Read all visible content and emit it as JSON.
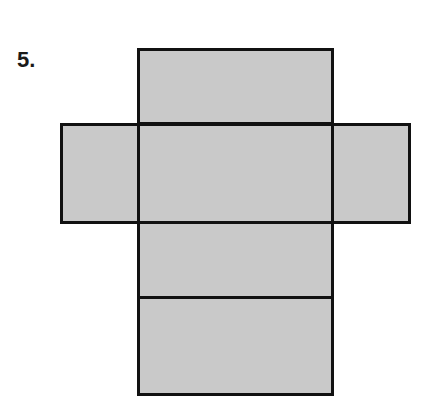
{
  "problem": {
    "number_label": "5."
  },
  "figure": {
    "type": "net-of-rectangular-prism",
    "fill_color": "#c9c9c9",
    "stroke_color": "#111111",
    "faces": [
      {
        "name": "top-face",
        "x": 137,
        "y": 48,
        "w": 197,
        "h": 77
      },
      {
        "name": "left-face",
        "x": 60,
        "y": 123,
        "w": 80,
        "h": 101
      },
      {
        "name": "center-face",
        "x": 137,
        "y": 123,
        "w": 197,
        "h": 101
      },
      {
        "name": "right-face",
        "x": 331,
        "y": 123,
        "w": 80,
        "h": 101
      },
      {
        "name": "lower-face",
        "x": 137,
        "y": 221,
        "w": 197,
        "h": 78
      },
      {
        "name": "bottom-face",
        "x": 137,
        "y": 296,
        "w": 197,
        "h": 100
      }
    ]
  }
}
